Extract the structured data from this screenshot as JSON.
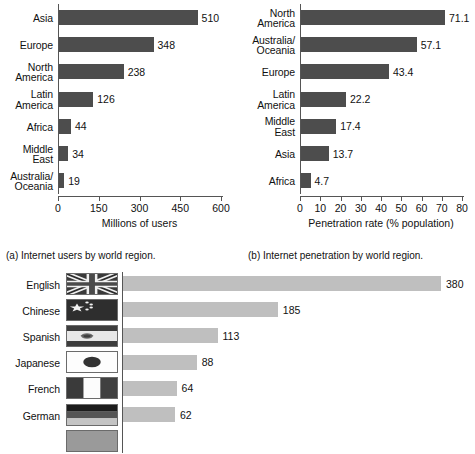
{
  "figure": {
    "captions": {
      "a": "(a) Internet users by world region.",
      "b": "(b) Internet penetration by world region."
    }
  },
  "colors": {
    "bar_dark": "#4d4d4d",
    "bar_light": "#bfbfbf",
    "axis": "#555555",
    "text": "#111111",
    "background": "#ffffff"
  },
  "chart_data": [
    {
      "id": "internet-users-by-region",
      "type": "bar",
      "orientation": "horizontal",
      "title": "",
      "caption": "(a) Internet users by world region.",
      "categories": [
        "Asia",
        "Europe",
        "North\nAmerica",
        "Latin\nAmerica",
        "Africa",
        "Middle\nEast",
        "Australia/\nOceania"
      ],
      "values": [
        510,
        348,
        238,
        126,
        44,
        34,
        19
      ],
      "value_labels": [
        "510",
        "348",
        "238",
        "126",
        "44",
        "34",
        "19"
      ],
      "xlabel": "Millions of users",
      "ylabel": "",
      "xlim": [
        0,
        600
      ],
      "xticks": [
        0,
        150,
        300,
        450,
        600
      ],
      "xtick_labels": [
        "0",
        "150",
        "300",
        "450",
        "600"
      ],
      "grid": false,
      "legend": "none",
      "bar_color": "#4d4d4d"
    },
    {
      "id": "internet-penetration-by-region",
      "type": "bar",
      "orientation": "horizontal",
      "title": "",
      "caption": "(b) Internet penetration by world region.",
      "categories": [
        "North\nAmerica",
        "Australia/\nOceania",
        "Europe",
        "Latin\nAmerica",
        "Middle\nEast",
        "Asia",
        "Africa"
      ],
      "values": [
        71.1,
        57.1,
        43.4,
        22.2,
        17.4,
        13.7,
        4.7
      ],
      "value_labels": [
        "71.1",
        "57.1",
        "43.4",
        "22.2",
        "17.4",
        "13.7",
        "4.7"
      ],
      "xlabel": "Penetration rate (% population)",
      "ylabel": "",
      "xlim": [
        0,
        80
      ],
      "xticks": [
        0,
        10,
        20,
        30,
        40,
        50,
        60,
        70,
        80
      ],
      "xtick_labels": [
        "0",
        "10",
        "20",
        "30",
        "40",
        "50",
        "60",
        "70",
        "80"
      ],
      "grid": false,
      "legend": "none",
      "bar_color": "#4d4d4d"
    },
    {
      "id": "internet-users-by-language",
      "type": "bar",
      "orientation": "horizontal",
      "title": "",
      "caption": "",
      "categories": [
        "English",
        "Chinese",
        "Spanish",
        "Japanese",
        "French",
        "German"
      ],
      "flags": [
        "united-kingdom-flag",
        "china-flag",
        "spain-flag",
        "japan-flag",
        "france-flag",
        "germany-flag"
      ],
      "values": [
        380,
        185,
        113,
        88,
        64,
        62
      ],
      "value_labels": [
        "380",
        "185",
        "113",
        "88",
        "64",
        "62"
      ],
      "xlabel": "",
      "ylabel": "",
      "xlim": [
        0,
        380
      ],
      "grid": false,
      "legend": "none",
      "bar_color": "#bfbfbf",
      "note": "chart is cropped at the bottom of the screenshot; a seventh row is partially visible"
    }
  ]
}
